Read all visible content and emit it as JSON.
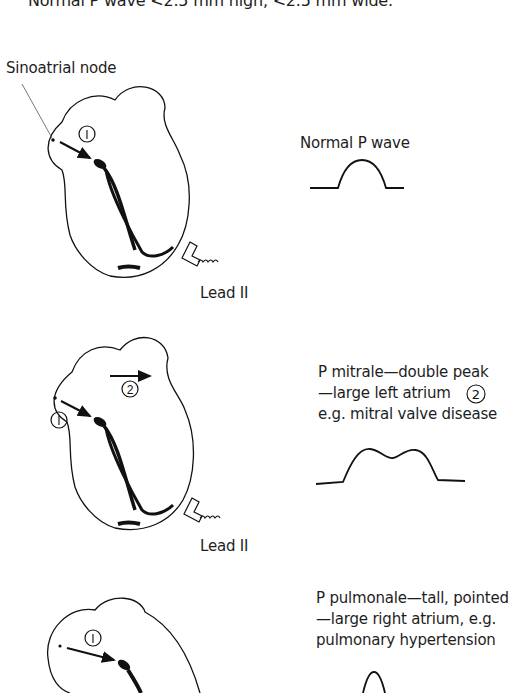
{
  "header": {
    "text": "Normal P wave <2.5 mm high, <2.5 mm wide."
  },
  "panels": [
    {
      "callout_label": "Sinoatrial node",
      "marker": "1",
      "lead_label": "Lead II",
      "caption": [
        "Normal P wave"
      ]
    },
    {
      "marker_1": "1",
      "marker_2": "2",
      "lead_label": "Lead II",
      "caption": [
        "P mitrale—double peak",
        "—large left atrium",
        "e.g. mitral valve disease"
      ],
      "caption_marker": "2"
    },
    {
      "marker": "1",
      "caption": [
        "P pulmonale—tall, pointed",
        "—large right atrium, e.g.",
        "pulmonary hypertension"
      ]
    }
  ]
}
